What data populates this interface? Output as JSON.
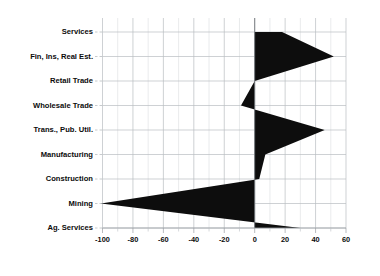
{
  "chart_data": {
    "type": "area",
    "title": "",
    "subtitle": "",
    "xlabel": "",
    "ylabel": "",
    "orientation": "horizontal",
    "grid": true,
    "legend": "none",
    "xlim": [
      -100,
      60
    ],
    "xticks": [
      -100,
      -80,
      -60,
      -40,
      -20,
      0,
      20,
      40,
      60
    ],
    "xtick_labels": [
      "-100",
      "-80",
      "-60",
      "-40",
      "-20",
      "0",
      "20",
      "40",
      "60"
    ],
    "xminor_step": 10,
    "categories": [
      "Services",
      "Fin, Ins, Real Est.",
      "Retail Trade",
      "Wholesale Trade",
      "Trans., Pub. Util.",
      "Manufacturing",
      "Construction",
      "Mining",
      "Ag. Services"
    ],
    "values": [
      18,
      52,
      0,
      -9,
      46,
      7,
      3,
      -101,
      30
    ],
    "series": [
      {
        "name": "value",
        "color": "#0d0d0d",
        "values": [
          18,
          52,
          0,
          -9,
          46,
          7,
          3,
          -101,
          30
        ]
      }
    ],
    "points": [
      {
        "category": "Services",
        "value": 18
      },
      {
        "category": "Fin, Ins, Real Est.",
        "value": 52
      },
      {
        "category": "Retail Trade",
        "value": 0
      },
      {
        "category": "Wholesale Trade",
        "value": -9
      },
      {
        "category": "Trans., Pub. Util.",
        "value": 46
      },
      {
        "category": "Manufacturing",
        "value": 7
      },
      {
        "category": "Construction",
        "value": 3
      },
      {
        "category": "Mining",
        "value": -101
      },
      {
        "category": "Ag. Services",
        "value": 30
      }
    ]
  },
  "axis": {
    "tick_0": "-100",
    "tick_1": "-80",
    "tick_2": "-60",
    "tick_3": "-40",
    "tick_4": "-20",
    "tick_5": "0",
    "tick_6": "20",
    "tick_7": "40",
    "tick_8": "60"
  },
  "labels": {
    "cat_0": "Services",
    "cat_1": "Fin, Ins, Real Est.",
    "cat_2": "Retail Trade",
    "cat_3": "Wholesale Trade",
    "cat_4": "Trans., Pub. Util.",
    "cat_5": "Manufacturing",
    "cat_6": "Construction",
    "cat_7": "Mining",
    "cat_8": "Ag. Services"
  },
  "colors": {
    "series": "#0d0d0d",
    "grid": "#b9bdc2",
    "grid_minor": "#d7dadd",
    "axis": "#9a9ea3",
    "text": "#0b0b0b",
    "background": "#ffffff"
  }
}
